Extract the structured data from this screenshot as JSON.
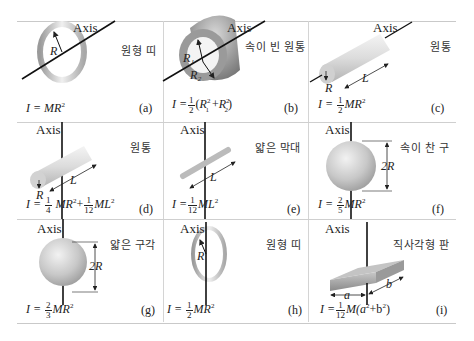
{
  "figure": {
    "axis_label": "Axis",
    "panels": [
      {
        "id": "a",
        "name": "원형 띠",
        "formula": "I = MR²",
        "tag": "(a)",
        "dims": [
          "R"
        ]
      },
      {
        "id": "b",
        "name": "속이 빈 원통",
        "formula": "I = 1/2 (R₁² + R₂²)",
        "tag": "(b)",
        "dims": [
          "R₁",
          "R₂"
        ]
      },
      {
        "id": "c",
        "name": "원통",
        "formula": "I = 1/2 MR²",
        "tag": "(c)",
        "dims": [
          "R",
          "L"
        ]
      },
      {
        "id": "d",
        "name": "원통",
        "formula": "I = 1/4 MR² + 1/12 ML²",
        "tag": "(d)",
        "dims": [
          "R",
          "L"
        ]
      },
      {
        "id": "e",
        "name": "얇은 막대",
        "formula": "I = 1/12 ML²",
        "tag": "(e)",
        "dims": [
          "L"
        ]
      },
      {
        "id": "f",
        "name": "속이 찬 구",
        "formula": "I = 2/5 MR²",
        "tag": "(f)",
        "dims": [
          "2R"
        ]
      },
      {
        "id": "g",
        "name": "얇은 구각",
        "formula": "I = 2/3 MR²",
        "tag": "(g)",
        "dims": [
          "2R"
        ]
      },
      {
        "id": "h",
        "name": "원형 띠",
        "formula": "I = 1/2 MR²",
        "tag": "(h)",
        "dims": [
          "R"
        ]
      },
      {
        "id": "i",
        "name": "직사각형 판",
        "formula": "I = 1/12 M(a² + b²)",
        "tag": "(i)",
        "dims": [
          "a",
          "b"
        ]
      }
    ]
  },
  "f": {
    "I": "I =",
    "MR2": "MR",
    "sq": "2",
    "ML2": "ML",
    "one": "1",
    "two": "2",
    "three": "3",
    "four": "4",
    "five": "5",
    "twelve": "12",
    "plus": "+",
    "R1": "R",
    "R2": "R",
    "sub1": "1",
    "sub2": "2",
    "M_open": "M(a",
    "b_close": "+b",
    "paren_open": "(",
    "paren_close": ")"
  }
}
